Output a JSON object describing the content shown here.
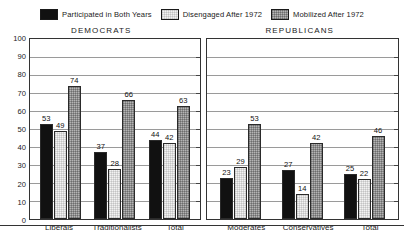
{
  "legend": {
    "entries": [
      {
        "label": "Participated in Both Years",
        "swatch": "solid-black-swatch"
      },
      {
        "label": "Disengaged After 1972",
        "swatch": "light-dotted-swatch"
      },
      {
        "label": "Mobilized After 1972",
        "swatch": "gray-checkered-swatch"
      }
    ]
  },
  "chart_data": {
    "type": "bar",
    "title": "",
    "xlabel": "",
    "ylabel": "",
    "ylim": [
      0,
      100
    ],
    "yticks": [
      0,
      10,
      20,
      30,
      40,
      50,
      60,
      70,
      80,
      90,
      100
    ],
    "grid": true,
    "legend_position": "top",
    "series_names": [
      "Participated in Both Years",
      "Disengaged After 1972",
      "Mobilized After 1972"
    ],
    "panels": [
      {
        "title": "DEMOCRATS",
        "categories": [
          "Liberals",
          "Traditionalists",
          "Total"
        ],
        "series": [
          {
            "name": "Participated in Both Years",
            "values": [
              53,
              37,
              44
            ]
          },
          {
            "name": "Disengaged After 1972",
            "values": [
              49,
              28,
              42
            ]
          },
          {
            "name": "Mobilized After 1972",
            "values": [
              74,
              66,
              63
            ]
          }
        ]
      },
      {
        "title": "REPUBLICANS",
        "categories": [
          "Moderates",
          "Conservatives",
          "Total"
        ],
        "series": [
          {
            "name": "Participated in Both Years",
            "values": [
              23,
              27,
              25
            ]
          },
          {
            "name": "Disengaged After 1972",
            "values": [
              29,
              14,
              22
            ]
          },
          {
            "name": "Mobilized After 1972",
            "values": [
              53,
              42,
              46
            ]
          }
        ]
      }
    ]
  },
  "colors": {
    "participated": "#111111",
    "disengaged": "#f2f2f2",
    "mobilized": "#b4b4b4",
    "axis": "#333333",
    "gridline": "#9a9a9a"
  }
}
